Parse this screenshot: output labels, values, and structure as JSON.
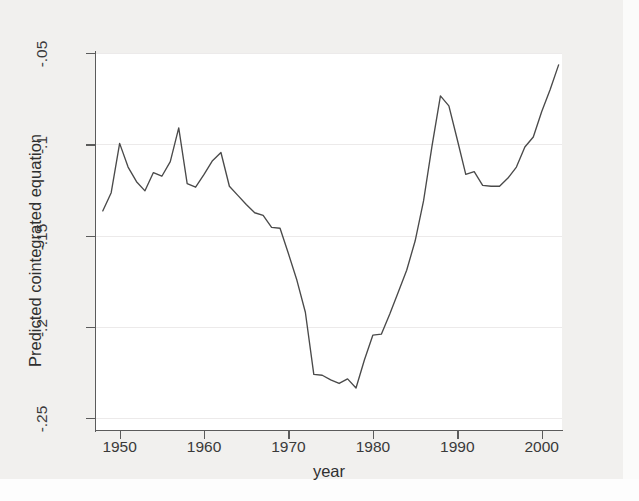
{
  "figure": {
    "background_color": "#f1f0ee",
    "plot_background_color": "#ffffff",
    "axis_color": "#5b5b5b",
    "line_color": "#4a4a4a",
    "gridline_color": "#eceaea"
  },
  "chart_data": {
    "type": "line",
    "title": "",
    "subtitle": "",
    "xlabel": "year",
    "ylabel": "Predicted cointegrated equation",
    "xlim": [
      1947.2,
      2002.4
    ],
    "ylim": [
      -0.2565,
      -0.05
    ],
    "xticks": [
      1950,
      1960,
      1970,
      1980,
      1990,
      2000
    ],
    "xticklabels": [
      "1950",
      "1960",
      "1970",
      "1980",
      "1990",
      "2000"
    ],
    "yticks": [
      -0.05,
      -0.1,
      -0.15,
      -0.2,
      -0.25
    ],
    "yticklabels": [
      "-.05",
      "-.1",
      "-.15",
      "-.2",
      "-.25"
    ],
    "grid": true,
    "grid_axis": "y",
    "legend": false,
    "legend_position": "none",
    "series": [
      {
        "name": "Predicted cointegrated equation",
        "color": "#4a4a4a",
        "x": [
          1948,
          1949,
          1950,
          1951,
          1952,
          1953,
          1954,
          1955,
          1956,
          1957,
          1958,
          1959,
          1960,
          1961,
          1962,
          1963,
          1964,
          1965,
          1966,
          1967,
          1968,
          1969,
          1970,
          1971,
          1972,
          1973,
          1974,
          1975,
          1976,
          1977,
          1978,
          1979,
          1980,
          1981,
          1982,
          1983,
          1984,
          1985,
          1986,
          1987,
          1988,
          1989,
          1990,
          1991,
          1992,
          1993,
          1994,
          1995,
          1996,
          1997,
          1998,
          1999,
          2000,
          2001,
          2002
        ],
        "y": [
          -0.1365,
          -0.1265,
          -0.0995,
          -0.1125,
          -0.1205,
          -0.1255,
          -0.1155,
          -0.1175,
          -0.1095,
          -0.091,
          -0.1215,
          -0.1235,
          -0.1165,
          -0.109,
          -0.1045,
          -0.123,
          -0.128,
          -0.133,
          -0.1375,
          -0.139,
          -0.1455,
          -0.146,
          -0.16,
          -0.1745,
          -0.192,
          -0.226,
          -0.2265,
          -0.229,
          -0.231,
          -0.2285,
          -0.2335,
          -0.218,
          -0.2045,
          -0.204,
          -0.193,
          -0.181,
          -0.169,
          -0.153,
          -0.131,
          -0.101,
          -0.0735,
          -0.079,
          -0.0975,
          -0.1165,
          -0.115,
          -0.1225,
          -0.123,
          -0.123,
          -0.1185,
          -0.1125,
          -0.1015,
          -0.096,
          -0.082,
          -0.07,
          -0.0565
        ]
      }
    ]
  },
  "axes": {
    "y_title": "Predicted cointegrated equation",
    "x_title": "year"
  }
}
